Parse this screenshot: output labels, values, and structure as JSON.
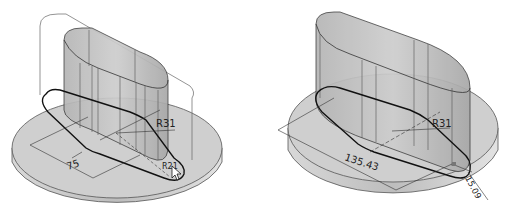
{
  "views": [
    {
      "id": "left",
      "description": "Swept/extruded slot boss on circular base with sketch being edited",
      "dimensions": [
        {
          "label": "75",
          "type": "linear"
        },
        {
          "label": "R31",
          "type": "radius"
        },
        {
          "label": "R21",
          "type": "radius"
        }
      ],
      "cursor": "pointer-arrow"
    },
    {
      "id": "right",
      "description": "Extruded slot boss on circular base with updated sketch",
      "dimensions": [
        {
          "label": "135.43",
          "type": "linear"
        },
        {
          "label": "R31",
          "type": "radius"
        },
        {
          "label": "15.09",
          "type": "linear"
        }
      ]
    }
  ],
  "colors": {
    "background": "#ffffff",
    "part_fill": "#c8c8c8",
    "part_dark": "#a9a9a9",
    "base_top": "#cfcfcf",
    "base_side": "#b8b8b8",
    "edge": "#2b2b2b",
    "sketch": "#111111"
  }
}
